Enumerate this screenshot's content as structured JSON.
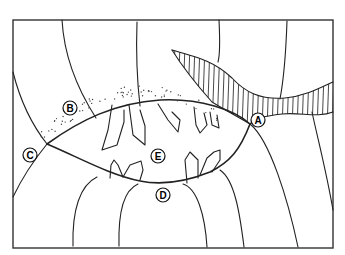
{
  "diagram": {
    "labels": [
      {
        "id": "A",
        "text": "A",
        "region": "hatched vein band"
      },
      {
        "id": "B",
        "text": "B",
        "region": "stippled zone"
      },
      {
        "id": "C",
        "text": "C",
        "region": "left junction point"
      },
      {
        "id": "D",
        "text": "D",
        "region": "lower boundary of cavity"
      },
      {
        "id": "E",
        "text": "E",
        "region": "crystal-filled cavity"
      }
    ],
    "colors": {
      "line": "#222222",
      "background": "#ffffff"
    }
  }
}
